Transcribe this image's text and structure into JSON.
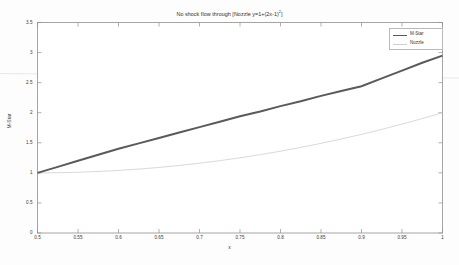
{
  "figure": {
    "title_main": "No shock flow through [Nozzle y=1+(2x-1)",
    "title_exp": "2",
    "title_tail": "]",
    "title_full": "No shock flow through [Nozzle y=1+(2x-1)2]",
    "background": "#fdfdfd"
  },
  "axes": {
    "xlabel": "x",
    "ylabel": "M-Star",
    "xticks": [
      "0.5",
      "0.55",
      "0.6",
      "0.65",
      "0.7",
      "0.75",
      "0.8",
      "0.85",
      "0.9",
      "0.95",
      "1"
    ],
    "yticks": [
      "0",
      "0.5",
      "1",
      "1.5",
      "2",
      "2.5",
      "3",
      "3.5"
    ]
  },
  "legend": {
    "position": "top-right",
    "entries": [
      {
        "label": "M-Star",
        "color": "#5a5a5a",
        "style": "thick"
      },
      {
        "label": "Nozzle",
        "color": "#cfcfcf",
        "style": "thin"
      }
    ]
  },
  "chart_data": {
    "type": "line",
    "title": "No shock flow through [Nozzle y=1+(2x-1)2]",
    "xlabel": "x",
    "ylabel": "M-Star",
    "xlim": [
      0.5,
      1
    ],
    "ylim": [
      0,
      3.5
    ],
    "xtick_step": 0.05,
    "ytick_step": 0.5,
    "grid": false,
    "legend_position": "top-right",
    "x": [
      0.5,
      0.525,
      0.55,
      0.575,
      0.6,
      0.625,
      0.65,
      0.675,
      0.7,
      0.725,
      0.75,
      0.775,
      0.8,
      0.825,
      0.85,
      0.875,
      0.9,
      0.925,
      0.95,
      0.975,
      1.0
    ],
    "series": [
      {
        "name": "M-Star",
        "color": "#5a5a5a",
        "linewidth": 2.0,
        "values": [
          1.0,
          1.1,
          1.2,
          1.3,
          1.4,
          1.49,
          1.58,
          1.67,
          1.76,
          1.85,
          1.94,
          2.02,
          2.11,
          2.19,
          2.28,
          2.36,
          2.44,
          2.57,
          2.7,
          2.83,
          2.95
        ]
      },
      {
        "name": "Nozzle",
        "color": "#cfcfcf",
        "linewidth": 0.8,
        "values": [
          1.0,
          1.003,
          1.01,
          1.023,
          1.04,
          1.063,
          1.09,
          1.123,
          1.16,
          1.203,
          1.25,
          1.303,
          1.36,
          1.423,
          1.49,
          1.563,
          1.64,
          1.723,
          1.81,
          1.903,
          2.0
        ]
      }
    ]
  }
}
